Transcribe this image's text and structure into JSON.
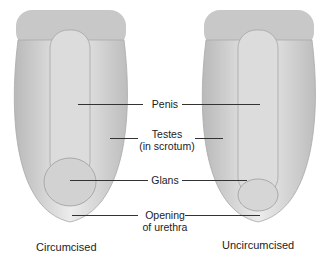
{
  "diagram": {
    "labels": {
      "penis": "Penis",
      "testes_line1": "Testes",
      "testes_line2": "(in scrotum)",
      "glans": "Glans",
      "opening_line1": "Opening",
      "opening_line2": "of urethra"
    },
    "captions": {
      "left": "Circumcised",
      "right": "Uncircumcised"
    },
    "colors": {
      "tissue_light": "#e8e8e8",
      "tissue_mid": "#c9c9c9",
      "tissue_dark": "#a8a8a8",
      "hair": "#8a8a8a",
      "line": "#333333"
    }
  }
}
